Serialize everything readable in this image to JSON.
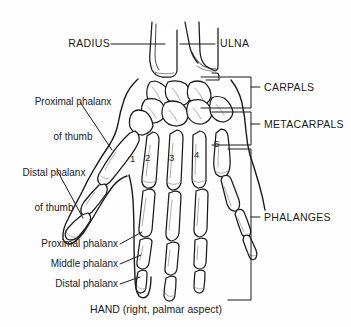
{
  "figure": {
    "caption": "HAND (right, palmar aspect)",
    "background_color": "#fefefe",
    "line_color": "#1a1a1a",
    "shading_color": "#8a8a8a"
  },
  "forearm_labels": [
    {
      "id": "radius",
      "text": "RADIUS",
      "align": "right"
    },
    {
      "id": "ulna",
      "text": "ULNA",
      "align": "left"
    }
  ],
  "thumb_labels": [
    {
      "id": "proximal-phalanx-thumb",
      "line1": "Proximal phalanx",
      "line2": "of thumb"
    },
    {
      "id": "distal-phalanx-thumb",
      "line1": "Distal phalanx",
      "line2": "of thumb"
    }
  ],
  "finger_labels": [
    {
      "id": "proximal-phalanx",
      "text": "Proximal phalanx"
    },
    {
      "id": "middle-phalanx",
      "text": "Middle phalanx"
    },
    {
      "id": "distal-phalanx",
      "text": "Distal phalanx"
    }
  ],
  "bracket_labels": [
    {
      "id": "carpals",
      "text": "CARPALS"
    },
    {
      "id": "metacarpals",
      "text": "METACARPALS"
    },
    {
      "id": "phalanges",
      "text": "PHALANGES"
    }
  ],
  "metacarpal_numbers": [
    {
      "id": "metacarpal-1",
      "text": "1"
    },
    {
      "id": "metacarpal-2",
      "text": "2"
    },
    {
      "id": "metacarpal-3",
      "text": "3"
    },
    {
      "id": "metacarpal-4",
      "text": "4"
    },
    {
      "id": "metacarpal-5",
      "text": "5"
    }
  ]
}
